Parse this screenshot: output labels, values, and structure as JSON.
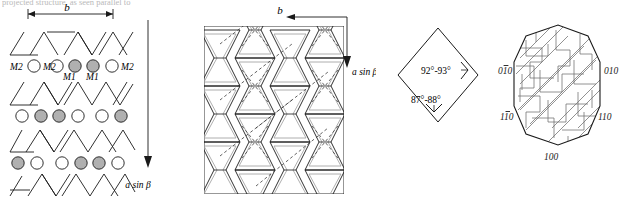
{
  "figure": {
    "clipped_header_text": "projected structure, as seen parallel to",
    "panels": [
      "projected-structure",
      "bowtie-lattice",
      "angle-diamond",
      "crystal-habit"
    ]
  },
  "panel_a": {
    "name": "projected-structure",
    "axis_top_label": "b",
    "axis_side_label": "a sin β",
    "site_labels": {
      "m2_left_outer": "M2",
      "m2_left_inner": "M2",
      "m2_right_outer": "M2",
      "m1_left": "M1",
      "m1_right": "M1"
    },
    "legend": {
      "m1_fill": "#b0b0b0",
      "m2_fill": "#ffffff"
    },
    "rows": [
      {
        "type": "triangles",
        "pattern": "up-down alternating"
      },
      {
        "type": "circles",
        "fills": [
          "open",
          "open",
          "filled",
          "filled",
          "open",
          "open"
        ]
      },
      {
        "type": "triangles",
        "pattern": "up-down alternating"
      },
      {
        "type": "circles",
        "fills": [
          "open",
          "filled",
          "filled",
          "open",
          "open",
          "filled"
        ]
      },
      {
        "type": "triangles",
        "pattern": "up-down alternating"
      },
      {
        "type": "circles",
        "fills": [
          "filled",
          "open",
          "open",
          "filled",
          "filled",
          "open"
        ]
      },
      {
        "type": "triangles",
        "pattern": "up-down alternating"
      }
    ]
  },
  "panel_b": {
    "name": "bowtie-lattice",
    "axis_top_label": "b",
    "axis_side_label": "a sin β",
    "columns": 4,
    "rows": 3,
    "description": "interlocking hourglass chains with dashed diagonal cross links"
  },
  "panel_c": {
    "name": "angle-diamond",
    "angle_upper": "92°-93°",
    "angle_lower": "87°-88°"
  },
  "panel_d": {
    "name": "crystal-habit",
    "faces": [
      {
        "id": "face-0-1bar-0",
        "digits": [
          "0",
          "1",
          "0"
        ],
        "bar_index": 1,
        "text": "010"
      },
      {
        "id": "face-010",
        "digits": [
          "0",
          "1",
          "0"
        ],
        "bar_index": -1,
        "text": "010"
      },
      {
        "id": "face-1-1bar-0",
        "digits": [
          "1",
          "1",
          "0"
        ],
        "bar_index": 1,
        "text": "110"
      },
      {
        "id": "face-110",
        "digits": [
          "1",
          "1",
          "0"
        ],
        "bar_index": -1,
        "text": "110"
      },
      {
        "id": "face-100",
        "digits": [
          "1",
          "0",
          "0"
        ],
        "bar_index": -1,
        "text": "100"
      }
    ]
  },
  "colors": {
    "ink": "#1a1a1a",
    "hatch": "#6e6e6e",
    "fill_gray": "#b0b0b0",
    "faint": "#9a9a9a"
  }
}
